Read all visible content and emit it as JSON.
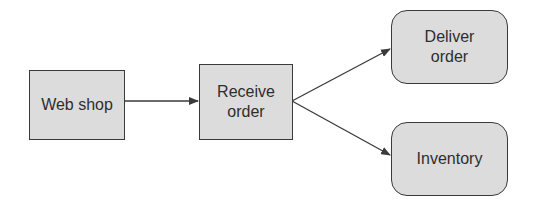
{
  "diagram": {
    "type": "flowchart",
    "nodes": [
      {
        "id": "web_shop",
        "label": "Web shop",
        "shape": "rectangle"
      },
      {
        "id": "receive_order",
        "label": "Receive\norder",
        "shape": "rectangle"
      },
      {
        "id": "deliver_order",
        "label": "Deliver\norder",
        "shape": "rounded-rectangle"
      },
      {
        "id": "inventory",
        "label": "Inventory",
        "shape": "rounded-rectangle"
      }
    ],
    "edges": [
      {
        "from": "web_shop",
        "to": "receive_order"
      },
      {
        "from": "receive_order",
        "to": "deliver_order"
      },
      {
        "from": "receive_order",
        "to": "inventory"
      }
    ]
  },
  "colors": {
    "node_fill": "#dcdcdc",
    "node_border": "#3a3a3a",
    "edge": "#3a3a3a",
    "text": "#2e2e2e"
  }
}
